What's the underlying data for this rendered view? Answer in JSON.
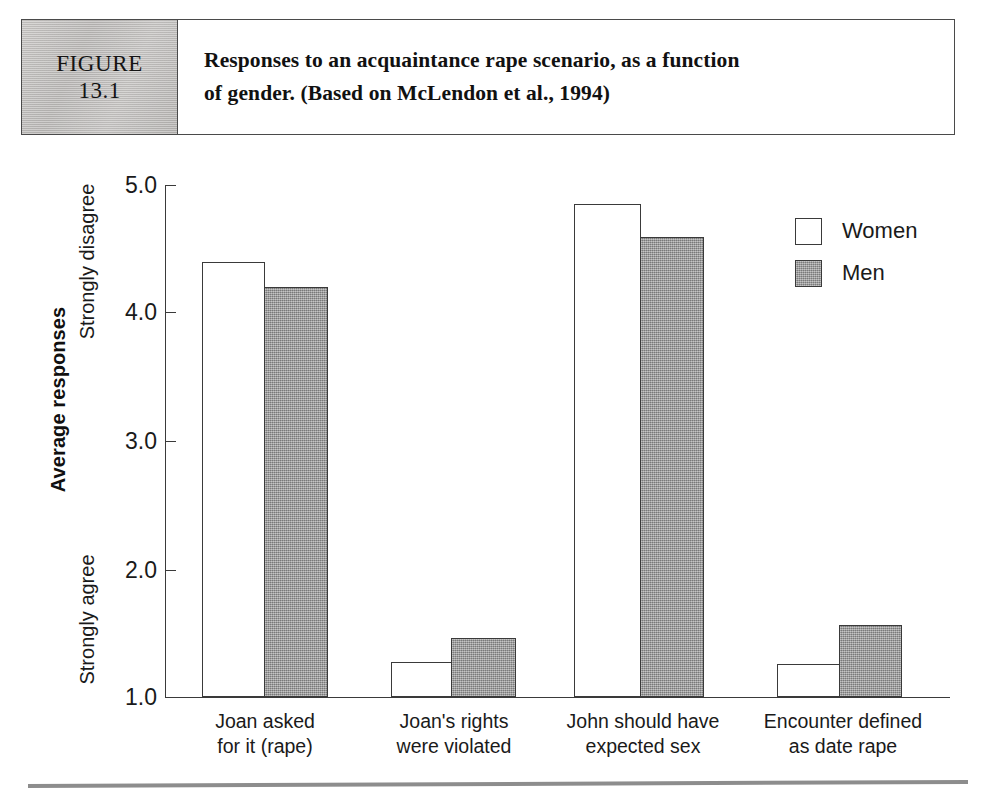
{
  "figure": {
    "badge_word": "FIGURE",
    "badge_number": "13.1",
    "caption_line1": "Responses to an acquaintance rape scenario, as a function",
    "caption_line2": "of gender. (Based on McLendon et al., 1994)"
  },
  "chart_data": {
    "type": "bar",
    "title": "Responses to an acquaintance rape scenario, as a function of gender. (Based on McLendon et al., 1994)",
    "xlabel": "",
    "ylabel": "Average responses",
    "ylim": [
      1.0,
      5.0
    ],
    "yticks": [
      "1.0",
      "2.0",
      "3.0",
      "4.0",
      "5.0"
    ],
    "ytick_values": [
      1.0,
      2.0,
      3.0,
      4.0,
      5.0
    ],
    "y_axis_low_label": "Strongly agree",
    "y_axis_high_label": "Strongly disagree",
    "grid": false,
    "legend_position": "top-right",
    "categories": [
      "Joan asked for it (rape)",
      "Joan's rights were violated",
      "John should have expected sex",
      "Encounter defined as date rape"
    ],
    "category_lines": [
      [
        "Joan asked",
        "for it (rape)"
      ],
      [
        "Joan's rights",
        "were violated"
      ],
      [
        "John should have",
        "expected sex"
      ],
      [
        "Encounter defined",
        "as date rape"
      ]
    ],
    "series": [
      {
        "name": "Women",
        "color": "#ffffff",
        "values": [
          4.4,
          1.27,
          4.85,
          1.26
        ]
      },
      {
        "name": "Men",
        "color": "#9a9a9a",
        "values": [
          4.2,
          1.46,
          4.59,
          1.56
        ]
      }
    ]
  }
}
